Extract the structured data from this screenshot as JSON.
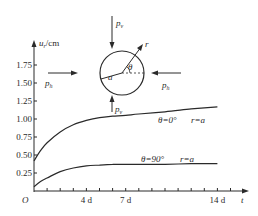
{
  "chart_data": {
    "type": "line",
    "title": "",
    "xlabel": "t",
    "ylabel": "u_r/cm",
    "origin_label": "O",
    "x_unit": "d",
    "xlim": [
      0,
      16
    ],
    "ylim": [
      0,
      1.9
    ],
    "x_tick_labels": [
      "4 d",
      "7 d",
      "14 d"
    ],
    "x_tick_label_values": [
      4,
      7,
      14
    ],
    "x_minor_tick_step": 1,
    "y_tick_labels": [
      "0.25",
      "0.50",
      "0.75",
      "1.00",
      "1.25",
      "1.50",
      "1.75"
    ],
    "y_tick_values": [
      0.25,
      0.5,
      0.75,
      1.0,
      1.25,
      1.5,
      1.75
    ],
    "grid": false,
    "series": [
      {
        "name": "θ=0° r=a",
        "theta_label": "θ=0°",
        "r_label": "r=a",
        "x": [
          0,
          0.5,
          1,
          2,
          3,
          4,
          5,
          6,
          7,
          8,
          10,
          12,
          14
        ],
        "values": [
          0.42,
          0.56,
          0.67,
          0.82,
          0.92,
          0.98,
          1.02,
          1.04,
          1.05,
          1.07,
          1.1,
          1.14,
          1.17
        ]
      },
      {
        "name": "θ=90° r=a",
        "theta_label": "θ=90°",
        "r_label": "r=a",
        "x": [
          0,
          0.5,
          1,
          2,
          3,
          4,
          5,
          6,
          7,
          8,
          10,
          12,
          14
        ],
        "values": [
          0.06,
          0.13,
          0.18,
          0.27,
          0.32,
          0.35,
          0.36,
          0.37,
          0.37,
          0.37,
          0.37,
          0.38,
          0.38
        ]
      }
    ],
    "inset_diagram": {
      "description": "Circular tunnel section under loads",
      "labels": {
        "vertical_load_top": "p_v",
        "vertical_load_bottom": "p_v",
        "horizontal_load_left": "p_h",
        "horizontal_load_right": "p_h",
        "radius": "a",
        "radial_coordinate": "r",
        "angle": "θ"
      }
    }
  },
  "labels": {
    "ylabel_main": "u",
    "ylabel_sub": "r",
    "ylabel_unit": "/cm",
    "xlabel": "t",
    "origin": "O",
    "curve1_theta": "θ=0°",
    "curve1_r": "r=a",
    "curve2_theta": "θ=90°",
    "curve2_r": "r=a",
    "pv_main": "p",
    "pv_sub": "v",
    "ph_main": "p",
    "ph_sub": "h",
    "radius": "a",
    "r": "r",
    "theta": "θ"
  }
}
